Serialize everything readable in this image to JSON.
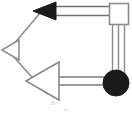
{
  "figure": {
    "title": "UML-style relationship diagram",
    "type": "node-link-diagram",
    "width": 132,
    "height": 115,
    "background_color": "#ffffff",
    "stroke_color": "#7a7a7a",
    "fill_dark": "#1a1a1a",
    "fill_light": "#ffffff"
  },
  "nodes": [
    {
      "id": "node-square",
      "shape": "square",
      "label": "",
      "fill": "#ffffff",
      "stroke": "#8a8a8a",
      "x": 109,
      "y": 3,
      "width": 20,
      "height": 22
    },
    {
      "id": "node-circle",
      "shape": "circle",
      "label": "",
      "fill": "#1a1a1a",
      "stroke": "#1a1a1a",
      "cx": 116,
      "cy": 83,
      "r": 13
    }
  ],
  "markers": [
    {
      "id": "arrowhead-filled-top",
      "shape": "triangle",
      "direction": "left",
      "fill": "#1a1a1a",
      "stroke": "#1a1a1a",
      "tip_x": 33,
      "tip_y": 11,
      "base_x": 56,
      "half_height": 9
    },
    {
      "id": "arrowhead-hollow-small",
      "shape": "triangle",
      "direction": "left",
      "fill": "#ffffff",
      "stroke": "#8a8a8a",
      "tip_x": 2,
      "tip_y": 50,
      "base_x": 19,
      "half_height": 10
    },
    {
      "id": "arrowhead-hollow-large",
      "shape": "triangle",
      "direction": "left",
      "fill": "#ffffff",
      "stroke": "#8a8a8a",
      "tip_x": 26,
      "tip_y": 81,
      "base_x": 59,
      "half_height": 19
    }
  ],
  "edges": [
    {
      "id": "edge-top-horizontal",
      "style": "double-line",
      "from": "node-square",
      "to": "arrowhead-filled-top",
      "x1": 56,
      "y1": 11,
      "x2": 111,
      "y2": 11
    },
    {
      "id": "edge-right-vertical",
      "style": "triple-line",
      "from": "node-square",
      "to": "node-circle",
      "x1": 118,
      "y1": 24,
      "x2": 118,
      "y2": 84
    },
    {
      "id": "edge-bottom-horizontal",
      "style": "double-line",
      "from": "node-circle",
      "to": "arrowhead-hollow-large",
      "x1": 59,
      "y1": 81,
      "x2": 110,
      "y2": 81
    },
    {
      "id": "edge-diagonal-upper",
      "style": "single-line",
      "from": "arrowhead-hollow-small",
      "to": "arrowhead-filled-top",
      "x1": 13,
      "y1": 45,
      "x2": 37,
      "y2": 14
    },
    {
      "id": "edge-diagonal-lower",
      "style": "single-line",
      "from": "arrowhead-hollow-small",
      "to": "arrowhead-hollow-large",
      "x1": 13,
      "y1": 56,
      "x2": 46,
      "y2": 92
    }
  ]
}
